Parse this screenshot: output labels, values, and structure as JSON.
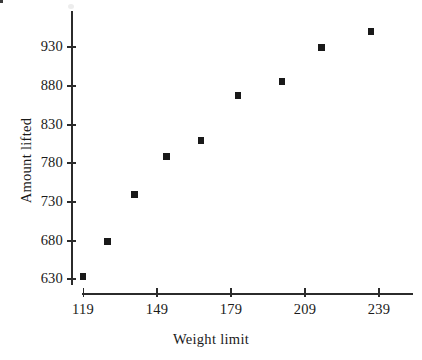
{
  "chart_data": {
    "type": "scatter",
    "title": "",
    "xlabel": "Weight limit",
    "ylabel": "Amount lifted",
    "xticks": [
      119,
      149,
      179,
      209,
      239
    ],
    "yticks": [
      630,
      680,
      730,
      780,
      830,
      880,
      930
    ],
    "xlim": [
      119,
      253
    ],
    "ylim": [
      624,
      965
    ],
    "grid": false,
    "legend": null,
    "marker": "square",
    "marker_color": "#191919",
    "points": [
      {
        "x": 119,
        "y": 632
      },
      {
        "x": 129,
        "y": 677
      },
      {
        "x": 140,
        "y": 738
      },
      {
        "x": 153,
        "y": 787
      },
      {
        "x": 167,
        "y": 808
      },
      {
        "x": 182,
        "y": 866
      },
      {
        "x": 200,
        "y": 884
      },
      {
        "x": 216,
        "y": 928
      },
      {
        "x": 236,
        "y": 949
      }
    ],
    "x": [
      119,
      129,
      140,
      153,
      167,
      182,
      200,
      216,
      236
    ],
    "y": [
      632,
      677,
      738,
      787,
      808,
      866,
      884,
      928,
      949
    ]
  },
  "axes": {
    "x_title": "Weight limit",
    "y_title": "Amount lifted",
    "x_tick_labels": [
      "119",
      "149",
      "179",
      "209",
      "239"
    ],
    "y_tick_labels": [
      "930",
      "880",
      "830",
      "780",
      "730",
      "680",
      "630"
    ],
    "axis_color": "#2b2b2b"
  }
}
